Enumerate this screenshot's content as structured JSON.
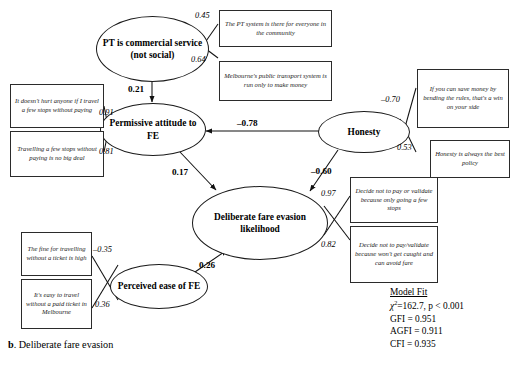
{
  "figure": {
    "caption_letter": "b",
    "caption_text": ". Deliberate fare evasion"
  },
  "latent_variables": [
    {
      "id": "pt_commercial",
      "label": "PT is commercial service (not social)"
    },
    {
      "id": "permissive_attitude",
      "label": "Permissive attitude to FE"
    },
    {
      "id": "honesty",
      "label": "Honesty"
    },
    {
      "id": "deliberate_fe",
      "label": "Deliberate fare evasion likelihood"
    },
    {
      "id": "perceived_ease",
      "label": "Perceived ease of FE"
    }
  ],
  "observed_variables": [
    {
      "id": "pt_community",
      "text": "The PT system is there for everyone in the community"
    },
    {
      "id": "melb_money",
      "text": "Melbourne's public transport system is run only to make money"
    },
    {
      "id": "doesnt_hurt",
      "text": "It doesn't hurt anyone if I travel a few stops without paying"
    },
    {
      "id": "no_big_deal",
      "text": "Travelling a few stops without paying is no big deal"
    },
    {
      "id": "bending_rules",
      "text": "If you can save money by bending the rules, that's a win on your side"
    },
    {
      "id": "best_policy",
      "text": "Honesty is always the best policy"
    },
    {
      "id": "few_stops",
      "text": "Decide not to pay or validate because only going a few stops"
    },
    {
      "id": "wont_get_caught",
      "text": "Decide not to pay/validate because won't get caught and can avoid fare"
    },
    {
      "id": "fine_is_high",
      "text": "The fine for travelling without a ticket is high"
    },
    {
      "id": "easy_to_travel",
      "text": "It's easy to travel without a paid ticket in Melbourne"
    }
  ],
  "paths": {
    "pt_to_permissive": "0.21",
    "honesty_to_permissive": "–0.78",
    "permissive_to_deliberate": "0.17",
    "honesty_to_deliberate": "–0.60",
    "ease_to_deliberate": "0.26"
  },
  "loadings": {
    "pt_community": "0.45",
    "melb_money": "0.64",
    "doesnt_hurt": "0.91",
    "no_big_deal": "0.81",
    "bending_rules": "–0.70",
    "best_policy": "0.53",
    "few_stops": "0.97",
    "wont_get_caught": "0.82",
    "fine_is_high": "–0.35",
    "easy_to_travel": "0.36"
  },
  "model_fit": {
    "title": "Model Fit",
    "chi_symbol": "χ",
    "chi_exponent": "2",
    "chi_value": "=162.7, p < 0.001",
    "gfi": "GFI = 0.951",
    "agfi": "AGFI = 0.911",
    "cfi": "CFI = 0.935"
  }
}
